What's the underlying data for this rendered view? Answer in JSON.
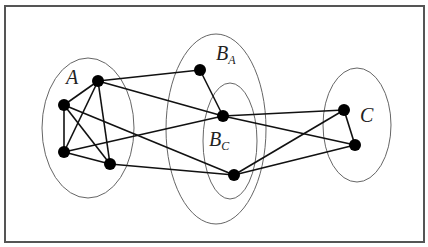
{
  "diagram": {
    "frame": {
      "x": 5,
      "y": 6,
      "width": 419,
      "height": 236
    },
    "sets": [
      {
        "id": "A",
        "label": "A",
        "sub": "",
        "cx": 88,
        "cy": 128,
        "rx": 46,
        "ry": 70,
        "label_x": 66,
        "label_y": 84
      },
      {
        "id": "BA",
        "label": "B",
        "sub": "A",
        "cx": 216,
        "cy": 129,
        "rx": 50,
        "ry": 95,
        "label_x": 216,
        "label_y": 60
      },
      {
        "id": "BC",
        "label": "B",
        "sub": "C",
        "cx": 230,
        "cy": 141,
        "rx": 27,
        "ry": 58,
        "label_x": 209,
        "label_y": 146
      },
      {
        "id": "C",
        "label": "C",
        "sub": "",
        "cx": 357,
        "cy": 125,
        "rx": 34,
        "ry": 57,
        "label_x": 360,
        "label_y": 122
      }
    ],
    "nodes": [
      {
        "id": "a1",
        "set": "A",
        "x": 98,
        "y": 81
      },
      {
        "id": "a2",
        "set": "A",
        "x": 64,
        "y": 105
      },
      {
        "id": "a3",
        "set": "A",
        "x": 64,
        "y": 152
      },
      {
        "id": "a4",
        "set": "A",
        "x": 110,
        "y": 164
      },
      {
        "id": "ba",
        "set": "BA",
        "x": 200,
        "y": 70
      },
      {
        "id": "bc1",
        "set": "BC",
        "x": 223,
        "y": 116
      },
      {
        "id": "bc2",
        "set": "BC",
        "x": 234,
        "y": 175
      },
      {
        "id": "c1",
        "set": "C",
        "x": 344,
        "y": 110
      },
      {
        "id": "c2",
        "set": "C",
        "x": 355,
        "y": 145
      }
    ],
    "edges": [
      [
        "a1",
        "a2"
      ],
      [
        "a1",
        "a3"
      ],
      [
        "a1",
        "a4"
      ],
      [
        "a2",
        "a3"
      ],
      [
        "a2",
        "a4"
      ],
      [
        "a3",
        "a4"
      ],
      [
        "a1",
        "ba"
      ],
      [
        "a1",
        "bc1"
      ],
      [
        "a2",
        "bc2"
      ],
      [
        "a3",
        "bc1"
      ],
      [
        "a4",
        "bc2"
      ],
      [
        "ba",
        "bc1"
      ],
      [
        "bc1",
        "c1"
      ],
      [
        "bc1",
        "c2"
      ],
      [
        "bc2",
        "c1"
      ],
      [
        "bc2",
        "c2"
      ],
      [
        "c1",
        "c2"
      ]
    ]
  }
}
